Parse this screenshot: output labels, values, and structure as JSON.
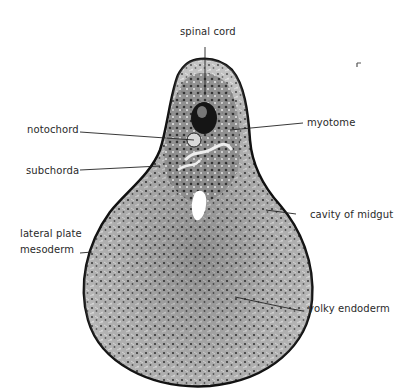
{
  "figure": {
    "labels": {
      "spinal_cord": "spinal cord",
      "myotome": "myotome",
      "notochord": "notochord",
      "subchorda": "subchorda",
      "cavity_of_midgut": "cavity of midgut",
      "lateral_plate_line1": "lateral plate",
      "lateral_plate_line2": "mesoderm",
      "yolky_endoderm": "yolky endoderm"
    },
    "colors": {
      "background": "#ffffff",
      "tissue_light": "#bdbdbd",
      "tissue_dark": "#2b2b2b",
      "outline": "#111111",
      "label_text": "#2a2a2a"
    }
  }
}
